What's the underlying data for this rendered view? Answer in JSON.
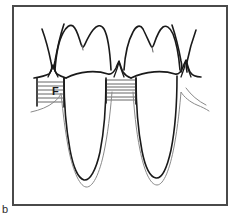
{
  "figure": {
    "panel_letter": "b",
    "caption_text": "",
    "frame": {
      "x": 13,
      "y": 6,
      "width": 214,
      "height": 199,
      "stroke_color": "#4a4a4a",
      "stroke_width": 2,
      "fill_color": "#ffffff"
    },
    "colors": {
      "ink": "#1a1a1a",
      "ink_light": "#6f6f6f",
      "hatch": "#555555",
      "background": "#ffffff",
      "frame": "#4a4a4a"
    },
    "annotations": [
      {
        "id": "furcation-label",
        "text": "F",
        "x": 52,
        "y": 93,
        "font_size": 11,
        "bold": true,
        "description": "furcation / bone defect marker on left tooth"
      }
    ],
    "diagram_type": "line-drawing",
    "structures": [
      {
        "name": "left-molar-crown",
        "label": ""
      },
      {
        "name": "right-molar-crown",
        "label": ""
      },
      {
        "name": "left-adjacent-tooth-partial",
        "label": ""
      },
      {
        "name": "right-adjacent-tooth-partial",
        "label": ""
      },
      {
        "name": "gingival-margin",
        "label": ""
      },
      {
        "name": "interdental-papilla",
        "label": ""
      },
      {
        "name": "alveolar-bone-hatch-left",
        "label": "F"
      },
      {
        "name": "alveolar-bone-hatch-center",
        "label": ""
      },
      {
        "name": "left-root",
        "label": ""
      },
      {
        "name": "right-root",
        "label": ""
      },
      {
        "name": "lamina-dura-outline",
        "label": ""
      }
    ],
    "hatch_blocks": [
      {
        "id": "hatch-left",
        "x": 36,
        "y": 78,
        "width": 28,
        "height": 26,
        "lines": 6
      },
      {
        "id": "hatch-center",
        "x": 106,
        "y": 78,
        "width": 30,
        "height": 24,
        "lines": 7
      }
    ]
  }
}
